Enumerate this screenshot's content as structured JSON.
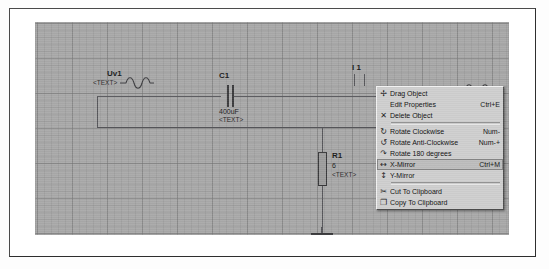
{
  "window": {
    "title": "Schematic Editor"
  },
  "canvas": {
    "name": "schematic-canvas",
    "grid": "gray-graph-paper"
  },
  "components": [
    {
      "id": "uv1",
      "type": "voltage-source",
      "name": "Uv1",
      "text": "<TEXT>",
      "value": ""
    },
    {
      "id": "c1",
      "type": "capacitor",
      "name": "C1",
      "value": "400uF",
      "text": "<TEXT>"
    },
    {
      "id": "r1",
      "type": "resistor",
      "name": "R1",
      "value": "6",
      "text": "<TEXT>"
    },
    {
      "id": "i1",
      "type": "current-source",
      "name": "I 1",
      "value": "",
      "text": ""
    },
    {
      "id": "gnd1",
      "type": "ground",
      "name": "",
      "value": "",
      "text": ""
    },
    {
      "id": "src-right",
      "type": "voltage-source",
      "name": "",
      "value": "",
      "text": ""
    }
  ],
  "context_menu": {
    "name": "object-context-menu",
    "items": [
      {
        "icon": "move-cross-icon",
        "label": "Drag Object",
        "accel": "",
        "highlighted": false,
        "separator_after": false
      },
      {
        "icon": "edit-properties-icon",
        "label": "Edit Properties",
        "accel": "Ctrl+E",
        "highlighted": false,
        "separator_after": false
      },
      {
        "icon": "delete-x-icon",
        "label": "Delete Object",
        "accel": "",
        "highlighted": false,
        "separator_after": true
      },
      {
        "icon": "rotate-cw-icon",
        "label": "Rotate Clockwise",
        "accel": "Num-",
        "highlighted": false,
        "separator_after": false
      },
      {
        "icon": "rotate-ccw-icon",
        "label": "Rotate Anti-Clockwise",
        "accel": "Num-+",
        "highlighted": false,
        "separator_after": false
      },
      {
        "icon": "rotate-180-icon",
        "label": "Rotate 180 degrees",
        "accel": "",
        "highlighted": false,
        "separator_after": false
      },
      {
        "icon": "x-mirror-icon",
        "label": "X-Mirror",
        "accel": "Ctrl+M",
        "highlighted": true,
        "separator_after": false
      },
      {
        "icon": "y-mirror-icon",
        "label": "Y-Mirror",
        "accel": "",
        "highlighted": false,
        "separator_after": true
      },
      {
        "icon": "scissors-icon",
        "label": "Cut To Clipboard",
        "accel": "",
        "highlighted": false,
        "separator_after": false
      },
      {
        "icon": "copy-icon",
        "label": "Copy To Clipboard",
        "accel": "",
        "highlighted": false,
        "separator_after": false
      }
    ]
  },
  "colors": {
    "canvas_bg": "#a9a9a9",
    "grid_line": "#787878",
    "wire": "#56565a",
    "menu_bg": "#cfcfcf",
    "menu_highlight": "#bdbdbd",
    "text": "#111111"
  }
}
